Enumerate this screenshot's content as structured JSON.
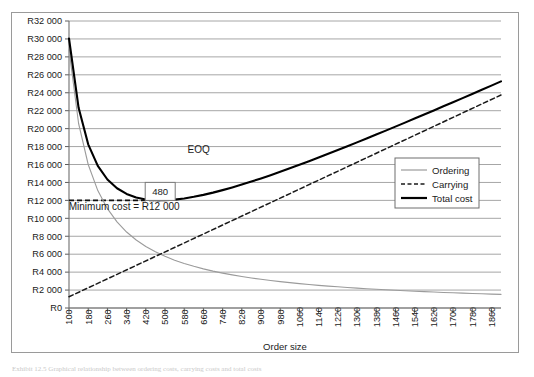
{
  "figure": {
    "caption": "Exhibit 12.5  Graphical relationship between ordering costs, carrying costs and total costs"
  },
  "chart_data": {
    "type": "line",
    "title": "",
    "xlabel": "Order size",
    "ylabel": "",
    "xlim": [
      100,
      1900
    ],
    "ylim": [
      0,
      32000
    ],
    "grid": true,
    "legend_position": "right",
    "currency_prefix": "R",
    "x_tick_labels": [
      "100",
      "180",
      "260",
      "340",
      "420",
      "500",
      "580",
      "660",
      "740",
      "820",
      "900",
      "980",
      "1060",
      "1140",
      "1220",
      "1300",
      "1380",
      "1460",
      "1540",
      "1620",
      "1700",
      "1780",
      "1860"
    ],
    "x_tick_values": [
      100,
      180,
      260,
      340,
      420,
      500,
      580,
      660,
      740,
      820,
      900,
      980,
      1060,
      1140,
      1220,
      1300,
      1380,
      1460,
      1540,
      1620,
      1700,
      1780,
      1860
    ],
    "y_tick_labels": [
      "R0",
      "R2 000",
      "R4 000",
      "R6 000",
      "R8 000",
      "R10 000",
      "R12 000",
      "R14 000",
      "R16 000",
      "R18 000",
      "R20 000",
      "R22 000",
      "R24 000",
      "R26 000",
      "R28 000",
      "R30 000",
      "R32 000"
    ],
    "y_tick_values": [
      0,
      2000,
      4000,
      6000,
      8000,
      10000,
      12000,
      14000,
      16000,
      18000,
      20000,
      22000,
      24000,
      26000,
      28000,
      30000,
      32000
    ],
    "model": {
      "demand_times_order_cost": 2880000,
      "holding_cost_per_unit": 25.0,
      "eoq": 480,
      "minimum_total_cost": 12000
    },
    "series": [
      {
        "name": "Ordering",
        "style": "solid",
        "color": "#9b9b9b",
        "width": 1.1,
        "formula": "2880000 / Q",
        "x": [
          100,
          140,
          180,
          220,
          260,
          300,
          340,
          380,
          420,
          460,
          500,
          540,
          580,
          620,
          660,
          700,
          740,
          780,
          820,
          860,
          900,
          940,
          980,
          1020,
          1060,
          1100,
          1140,
          1180,
          1220,
          1260,
          1300,
          1340,
          1380,
          1420,
          1460,
          1500,
          1540,
          1580,
          1620,
          1660,
          1700,
          1740,
          1780,
          1820,
          1860,
          1900
        ],
        "y": [
          28800,
          20571,
          16000,
          13091,
          11077,
          9600,
          8471,
          7579,
          6857,
          6261,
          5760,
          5333,
          4966,
          4645,
          4364,
          4114,
          3892,
          3692,
          3512,
          3349,
          3200,
          3064,
          2939,
          2824,
          2717,
          2618,
          2526,
          2441,
          2361,
          2286,
          2215,
          2149,
          2087,
          2028,
          1973,
          1920,
          1870,
          1823,
          1778,
          1735,
          1694,
          1655,
          1618,
          1582,
          1548,
          1516
        ]
      },
      {
        "name": "Carrying",
        "style": "dashed",
        "color": "#1a1a1a",
        "width": 1.5,
        "formula": "Q * 25 / 2",
        "x": [
          100,
          1900
        ],
        "y": [
          1250,
          23750
        ]
      },
      {
        "name": "Total cost",
        "style": "solid",
        "color": "#000000",
        "width": 2.1,
        "formula": "2880000/Q + Q*25/2",
        "x": [
          100,
          140,
          180,
          220,
          260,
          300,
          340,
          380,
          420,
          460,
          500,
          540,
          580,
          620,
          660,
          700,
          740,
          780,
          820,
          860,
          900,
          940,
          980,
          1020,
          1060,
          1100,
          1140,
          1180,
          1220,
          1260,
          1300,
          1340,
          1380,
          1420,
          1460,
          1500,
          1540,
          1580,
          1620,
          1660,
          1700,
          1740,
          1780,
          1820,
          1860,
          1900
        ],
        "y": [
          30050,
          22321,
          18250,
          15841,
          14327,
          13350,
          12721,
          12329,
          12107,
          12011,
          12010,
          12083,
          12216,
          12395,
          12614,
          12864,
          13142,
          13442,
          13762,
          14099,
          14450,
          14814,
          15189,
          15574,
          15967,
          16368,
          16776,
          17191,
          17611,
          18036,
          18465,
          18899,
          19337,
          19778,
          20223,
          20670,
          21120,
          21573,
          22028,
          22485,
          22944,
          23405,
          23868,
          24332,
          24798,
          25266
        ]
      }
    ],
    "annotations": [
      {
        "name": "eoq-label",
        "text": "EOQ",
        "x": 640,
        "y": 17300
      },
      {
        "name": "eoq-value-box",
        "text": "480",
        "x": 480,
        "y": 13000
      },
      {
        "name": "minimum-cost-label",
        "text": "Minimum cost = R12 000",
        "x": 330,
        "y": 10900
      },
      {
        "name": "minimum-cost-guide",
        "text": "",
        "x": 100,
        "y": 12000
      }
    ],
    "legend_entries": [
      {
        "label": "Ordering",
        "style": "solid",
        "color": "#9b9b9b",
        "width": 1.2
      },
      {
        "label": "Carrying",
        "style": "dashed",
        "color": "#1a1a1a",
        "width": 1.5
      },
      {
        "label": "Total cost",
        "style": "solid",
        "color": "#000000",
        "width": 2.2
      }
    ]
  }
}
